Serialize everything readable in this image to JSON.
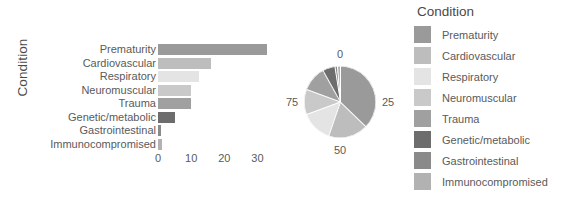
{
  "figure": {
    "y_axis_title": "Condition",
    "legend_title": "Condition"
  },
  "colors": {
    "prematurity": "#9a9a9a",
    "cardiovascular": "#bdbdbd",
    "respiratory": "#e4e4e4",
    "neuromuscular": "#c9c9c9",
    "trauma": "#a0a0a0",
    "genetic_metabolic": "#6d6d6d",
    "gastrointestinal": "#8a8a8a",
    "immunocompromised": "#b2b2b2",
    "text": "#5a5a5a",
    "background": "#ffffff"
  },
  "chart_data": [
    {
      "type": "bar",
      "title": "",
      "orientation": "horizontal",
      "xlabel": "",
      "ylabel": "Condition",
      "xlim": [
        0,
        35
      ],
      "xticks": [
        0,
        10,
        20,
        30
      ],
      "xtick_labels": [
        "0",
        "10",
        "20",
        "30"
      ],
      "grid": false,
      "categories": [
        "Prematurity",
        "Cardiovascular",
        "Respiratory",
        "Neuromuscular",
        "Trauma",
        "Genetic/metabolic",
        "Gastrointestinal",
        "Immunocompromised"
      ],
      "values": [
        33,
        16,
        12.5,
        10,
        10,
        5,
        1,
        1.2
      ]
    },
    {
      "type": "pie",
      "title": "",
      "labels": [
        "Prematurity",
        "Cardiovascular",
        "Respiratory",
        "Neuromuscular",
        "Trauma",
        "Genetic/metabolic",
        "Gastrointestinal",
        "Immunocompromised"
      ],
      "values": [
        33,
        16,
        12.5,
        10,
        10,
        5,
        1,
        1.2
      ],
      "percentages": [
        37.1,
        18.0,
        14.0,
        11.2,
        11.2,
        5.6,
        1.1,
        1.8
      ],
      "axis_labels": [
        "0",
        "25",
        "50",
        "75"
      ],
      "legend_position": "right"
    }
  ],
  "legend": {
    "title": "Condition",
    "items": [
      {
        "label": "Prematurity",
        "color": "#9a9a9a"
      },
      {
        "label": "Cardiovascular",
        "color": "#bdbdbd"
      },
      {
        "label": "Respiratory",
        "color": "#e4e4e4"
      },
      {
        "label": "Neuromuscular",
        "color": "#c9c9c9"
      },
      {
        "label": "Trauma",
        "color": "#a0a0a0"
      },
      {
        "label": "Genetic/metabolic",
        "color": "#6d6d6d"
      },
      {
        "label": "Gastrointestinal",
        "color": "#8a8a8a"
      },
      {
        "label": "Immunocompromised",
        "color": "#b2b2b2"
      }
    ]
  }
}
